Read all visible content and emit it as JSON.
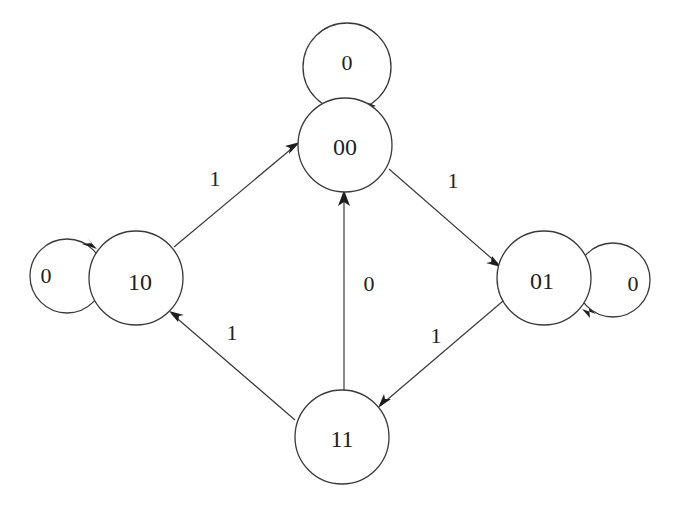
{
  "diagram": {
    "type": "state-transition-diagram",
    "nodes": {
      "n00": {
        "label": "00"
      },
      "n01": {
        "label": "01"
      },
      "n10": {
        "label": "10"
      },
      "n11": {
        "label": "11"
      }
    },
    "self_loops": {
      "n00": {
        "label": "0"
      },
      "n01": {
        "label": "0"
      },
      "n10": {
        "label": "0"
      }
    },
    "edges": {
      "e10_00": {
        "from": "10",
        "to": "00",
        "label": "1"
      },
      "e00_01": {
        "from": "00",
        "to": "01",
        "label": "1"
      },
      "e11_10": {
        "from": "11",
        "to": "10",
        "label": "1"
      },
      "e01_11": {
        "from": "01",
        "to": "11",
        "label": "1"
      },
      "e11_00": {
        "from": "11",
        "to": "00",
        "label": "0"
      }
    },
    "colors": {
      "stroke": "#3a3a3a",
      "text": "#222222",
      "background": "#ffffff"
    }
  }
}
